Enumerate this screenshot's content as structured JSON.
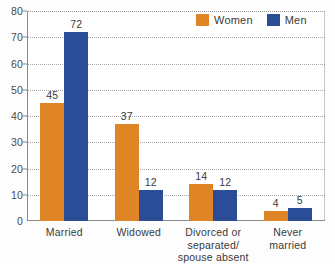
{
  "chart_data": {
    "type": "bar",
    "title": "",
    "xlabel": "",
    "ylabel": "",
    "ylim": [
      0,
      80
    ],
    "yticks": [
      0,
      10,
      20,
      30,
      40,
      50,
      60,
      70,
      80
    ],
    "grid": true,
    "legend_position": "top-right",
    "categories": [
      "Married",
      "Widowed",
      "Divorced or\nseparated/\nspouse absent",
      "Never\nmarried"
    ],
    "category_lines": [
      [
        "Married"
      ],
      [
        "Widowed"
      ],
      [
        "Divorced or",
        "separated/",
        "spouse absent"
      ],
      [
        "Never",
        "married"
      ]
    ],
    "series": [
      {
        "name": "Women",
        "color": "#e08526",
        "values": [
          45,
          37,
          14,
          4
        ]
      },
      {
        "name": "Men",
        "color": "#2b4c96",
        "values": [
          72,
          12,
          12,
          5
        ]
      }
    ]
  },
  "legend": {
    "items": [
      {
        "label": "Women",
        "color": "#e08526"
      },
      {
        "label": "Men",
        "color": "#2b4c96"
      }
    ]
  },
  "colors": {
    "women": "#e08526",
    "men": "#2b4c96",
    "axis": "#8a8a8a",
    "grid": "#a8a8a8",
    "text": "#3a3a3a",
    "background": "#ffffff"
  }
}
